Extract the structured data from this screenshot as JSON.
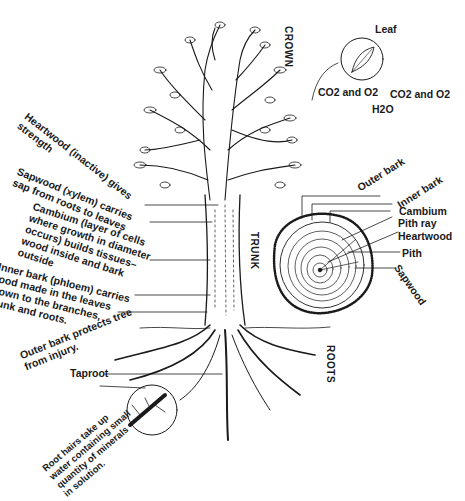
{
  "diagram": {
    "sections": {
      "crown": "CROWN",
      "trunk": "TRUNK",
      "roots": "ROOTS"
    },
    "leaf_inset": {
      "title": "Leaf",
      "gas_left": "CO2 and O2",
      "gas_right": "CO2 and O2",
      "water": "H2O"
    },
    "trunk_labels": [
      {
        "text": "Heartwood (inactive) gives\nstrength"
      },
      {
        "text": "Sapwood (xylem) carries\nsap from roots to leaves"
      },
      {
        "text": "Cambium (layer of cells\nwhere growth in diameter\noccurs) builds tissues–\nwood inside and bark\noutside"
      },
      {
        "text": "Inner bark (phloem) carries\nfood made in the leaves\ndown to the branches,\ntrunk and roots."
      },
      {
        "text": "Outer bark protects tree\nfrom injury."
      }
    ],
    "cross_section_labels": {
      "outer_bark": "Outer bark",
      "inner_bark": "Inner bark",
      "cambium": "Cambium",
      "pith_ray": "Pith ray",
      "heartwood": "Heartwood",
      "pith": "Pith",
      "sapwood": "Sapwood"
    },
    "root_labels": {
      "taproot": "Taproot",
      "root_hairs": "Root hairs take up\nwater containing small\nquantity of minerals\nin solution."
    },
    "colors": {
      "ink": "#1a1a1a",
      "background": "#ffffff"
    }
  }
}
